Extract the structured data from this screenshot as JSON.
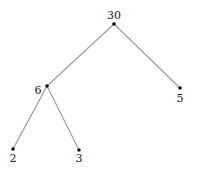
{
  "diagram": {
    "type": "factor-tree",
    "nodes": [
      {
        "id": "n30",
        "label": "30",
        "x": 114,
        "y": 24,
        "lx": 114,
        "ly": 19
      },
      {
        "id": "n6",
        "label": "6",
        "x": 47,
        "y": 86,
        "lx": 38,
        "ly": 94
      },
      {
        "id": "n5",
        "label": "5",
        "x": 180,
        "y": 88,
        "lx": 180,
        "ly": 102
      },
      {
        "id": "n2",
        "label": "2",
        "x": 13,
        "y": 149,
        "lx": 13,
        "ly": 162
      },
      {
        "id": "n3",
        "label": "3",
        "x": 79,
        "y": 150,
        "lx": 79,
        "ly": 162
      }
    ],
    "edges": [
      {
        "from": "n30",
        "to": "n6"
      },
      {
        "from": "n30",
        "to": "n5"
      },
      {
        "from": "n6",
        "to": "n2"
      },
      {
        "from": "n6",
        "to": "n3"
      }
    ],
    "edge_color": "#a0a0a0",
    "node_color": "#111111"
  }
}
